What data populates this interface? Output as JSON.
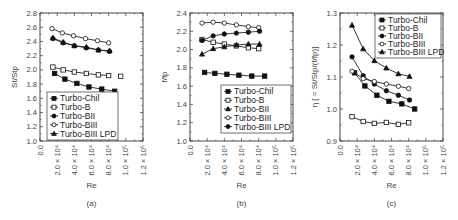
{
  "chart_data": [
    {
      "id": "a",
      "type": "line",
      "panel_label": "(a)",
      "xlabel": "Re",
      "ylabel": "St/St_p",
      "xlim": [
        0,
        120000
      ],
      "ylim": [
        1.0,
        2.8
      ],
      "xticks": [
        0,
        20000,
        40000,
        60000,
        80000,
        100000,
        120000
      ],
      "xtick_labels": [
        "0.0",
        "2.0 × 10⁴",
        "4.0 × 10⁴",
        "6.0 × 10⁴",
        "8.0 × 10⁴",
        "1.0 × 10⁵",
        "1.2 × 10⁵"
      ],
      "yticks": [
        1.0,
        1.2,
        1.4,
        1.6,
        1.8,
        2.0,
        2.2,
        2.4,
        2.6,
        2.8
      ],
      "ytick_labels": [
        "1.0",
        "1.2",
        "1.4",
        "1.6",
        "1.8",
        "2.0",
        "2.2",
        "2.4",
        "2.6",
        "2.8"
      ],
      "legend_position": "lower left",
      "grid": false,
      "series": [
        {
          "name": "Turbo-Chil",
          "marker": "square-filled",
          "x": [
            17000,
            29000,
            43000,
            57000,
            72000,
            87000
          ],
          "y": [
            1.95,
            1.87,
            1.81,
            1.76,
            1.73,
            1.7
          ]
        },
        {
          "name": "Turbo-B",
          "marker": "square-open",
          "x": [
            15000,
            27000,
            40000,
            54000,
            68000,
            80000,
            94000
          ],
          "y": [
            2.04,
            2.0,
            1.97,
            1.95,
            1.93,
            1.92,
            1.91
          ]
        },
        {
          "name": "Turbo-BII",
          "marker": "circle-filled",
          "x": [
            15000,
            27000,
            40000,
            54000,
            68000,
            81000
          ],
          "y": [
            2.44,
            2.38,
            2.34,
            2.31,
            2.28,
            2.26
          ]
        },
        {
          "name": "Turbo-BIII",
          "marker": "circle-open",
          "x": [
            14000,
            26000,
            39000,
            53000,
            67000,
            80000
          ],
          "y": [
            2.58,
            2.52,
            2.48,
            2.44,
            2.41,
            2.38
          ]
        },
        {
          "name": "Turbo-BIII LPD",
          "marker": "triangle-filled",
          "x": [
            15000,
            27000,
            40000,
            54000,
            68000,
            81000
          ],
          "y": [
            2.45,
            2.39,
            2.34,
            2.32,
            2.28,
            2.27
          ]
        }
      ]
    },
    {
      "id": "b",
      "type": "line",
      "panel_label": "(b)",
      "xlabel": "Re",
      "ylabel": "f/f_p",
      "xlim": [
        0,
        120000
      ],
      "ylim": [
        1.0,
        2.4
      ],
      "xticks": [
        0,
        20000,
        40000,
        60000,
        80000,
        100000,
        120000
      ],
      "xtick_labels": [
        "0.0",
        "2.0 × 10⁴",
        "4.0 × 10⁴",
        "6.0 × 10⁴",
        "8.0 × 10⁴",
        "1.0 × 10⁵",
        "1.2 × 10⁵"
      ],
      "yticks": [
        1.0,
        1.2,
        1.4,
        1.6,
        1.8,
        2.0,
        2.2,
        2.4
      ],
      "ytick_labels": [
        "1.0",
        "1.2",
        "1.4",
        "1.6",
        "1.8",
        "2.0",
        "2.2",
        "2.4"
      ],
      "legend_position": "lower right",
      "grid": false,
      "series": [
        {
          "name": "Turbo-Chil",
          "marker": "square-filled",
          "x": [
            17000,
            29000,
            43000,
            57000,
            72000,
            87000
          ],
          "y": [
            1.75,
            1.74,
            1.73,
            1.72,
            1.71,
            1.71
          ]
        },
        {
          "name": "Turbo-B",
          "marker": "square-open",
          "x": [
            14000,
            27000,
            40000,
            54000,
            68000,
            80000
          ],
          "y": [
            2.11,
            2.08,
            2.06,
            2.04,
            2.02,
            2.01
          ]
        },
        {
          "name": "Turbo-BII",
          "marker": "triangle-filled",
          "x": [
            14000,
            27000,
            40000,
            54000,
            68000,
            81000
          ],
          "y": [
            1.95,
            2.01,
            2.03,
            2.05,
            2.06,
            2.06
          ]
        },
        {
          "name": "Turbo-BIII",
          "marker": "circle-open",
          "x": [
            14000,
            27000,
            40000,
            54000,
            68000,
            80000
          ],
          "y": [
            2.29,
            2.3,
            2.29,
            2.27,
            2.25,
            2.24
          ]
        },
        {
          "name": "Turbo-BIII LPD",
          "marker": "circle-filled",
          "x": [
            14000,
            27000,
            40000,
            54000,
            68000,
            81000
          ],
          "y": [
            2.1,
            2.15,
            2.17,
            2.18,
            2.19,
            2.2
          ]
        }
      ]
    },
    {
      "id": "c",
      "type": "line",
      "panel_label": "(c)",
      "xlabel": "Re",
      "ylabel": "η [ = St/St_p/(f/f_p)]",
      "xlim": [
        0,
        120000
      ],
      "ylim": [
        0.9,
        1.3
      ],
      "xticks": [
        0,
        20000,
        40000,
        60000,
        80000,
        100000,
        120000
      ],
      "xtick_labels": [
        "0.0",
        "2.0 × 10⁴",
        "4.0 × 10⁴",
        "6.0 × 10⁴",
        "8.0 × 10⁴",
        "1.0 × 10⁵",
        "1.2 × 10⁵"
      ],
      "yticks": [
        0.9,
        1.0,
        1.1,
        1.2,
        1.3
      ],
      "ytick_labels": [
        "0.9",
        "1.0",
        "1.1",
        "1.2",
        "1.3"
      ],
      "legend_position": "upper right",
      "grid": false,
      "series": [
        {
          "name": "Turbo-Chil",
          "marker": "square-filled",
          "x": [
            17000,
            29000,
            43000,
            57000,
            72000,
            87000
          ],
          "y": [
            1.113,
            1.072,
            1.043,
            1.024,
            1.016,
            1.0
          ]
        },
        {
          "name": "Turbo-B",
          "marker": "square-open",
          "x": [
            14000,
            27000,
            40000,
            54000,
            68000,
            80000
          ],
          "y": [
            0.976,
            0.961,
            0.955,
            0.958,
            0.952,
            0.957
          ]
        },
        {
          "name": "Turbo-BII",
          "marker": "circle-filled",
          "x": [
            14000,
            27000,
            40000,
            54000,
            68000,
            81000
          ],
          "y": [
            1.163,
            1.104,
            1.078,
            1.057,
            1.043,
            1.028
          ]
        },
        {
          "name": "Turbo-BIII",
          "marker": "circle-open",
          "x": [
            14000,
            27000,
            40000,
            54000,
            68000,
            80000
          ],
          "y": [
            1.118,
            1.095,
            1.086,
            1.078,
            1.071,
            1.064
          ]
        },
        {
          "name": "Turbo-BIII LPD",
          "marker": "triangle-filled",
          "x": [
            14000,
            27000,
            40000,
            54000,
            68000,
            81000
          ],
          "y": [
            1.262,
            1.188,
            1.151,
            1.128,
            1.11,
            1.102
          ]
        }
      ]
    }
  ]
}
